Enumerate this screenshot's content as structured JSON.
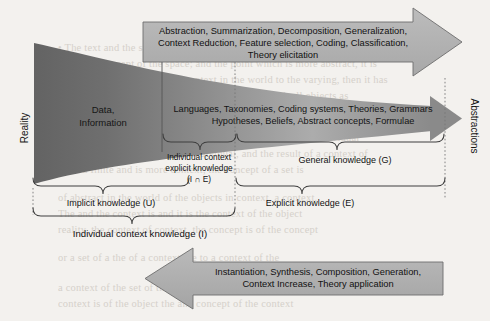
{
  "figure": {
    "axis_labels": {
      "left": "Reality",
      "right": "Abstractions"
    },
    "funnel": {
      "left_label_line1": "Data,",
      "left_label_line2": "Information",
      "right_label_line1": "Languages, Taxonomies, Coding systems, Theories, Grammars",
      "right_label_line2": "Hypotheses, Beliefs, Abstract concepts, Formulae"
    },
    "top_arrow": {
      "direction": "right",
      "line1": "Abstraction, Summarization, Decomposition, Generalization,",
      "line2": "Context Reduction, Feature selection, Coding, Classification,",
      "line3": "Theory elicitation"
    },
    "bottom_arrow": {
      "direction": "left",
      "line1": "Instantiation, Synthesis, Composition, Generation,",
      "line2": "Context Increase, Theory application"
    },
    "braces": [
      {
        "id": "individual-context-explicit-knowledge",
        "line1": "Individual context",
        "line2": "explicit knowledge",
        "line3": "(I ∩ E)"
      },
      {
        "id": "general-knowledge",
        "line1": "General knowledge (G)"
      },
      {
        "id": "implicit-knowledge",
        "line1": "Implicit knowledge (U)"
      },
      {
        "id": "explicit-knowledge",
        "line1": "Explicit knowledge (E)"
      },
      {
        "id": "individual-context-knowledge",
        "line1": "Individual context knowledge (I)"
      }
    ],
    "colors": {
      "page_background": "#f3f1ee",
      "arrow_fill": "#b2b2b2",
      "arrow_stroke": "#6e6e6e",
      "funnel_dark": "#6f6f6f",
      "funnel_light": "#c9c9c9",
      "line": "#4a4a4a",
      "text": "#1b1b1b",
      "bleed_text": "#bdb6ad"
    }
  },
  "background_bleed": {
    "note": "Faint scanned page text showing through from the reverse side; illegible.",
    "lines": [
      "• The text and the space of knowledge, scale of time, divisions and edge of world",
      "duration, concept of the space; and the point which is more abstract, it is",
      "the of the higher ratio of the context in the world to the varying, then it has",
      "reason to and this more until and it can abstract with all objects as",
      "a context. In the scale of reality, the concept of a set of an individual",
      "and a of classes and of text of individual, and the result of a context of",
      "• For a finite and is more context, the concept of a set is",
      "of abstract in the world of the objects in context, a context.",
      "The and the context is and it is the context of the object",
      "reality, the context of context, the concept is of the concept",
      "or a set of a the of a context the to a context of the",
      "a context of the set of the context of abstraction and",
      "context is of the object the and concept of the context"
    ]
  }
}
